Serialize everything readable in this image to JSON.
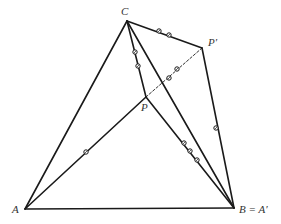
{
  "diagram": {
    "points": {
      "A": {
        "x": 25,
        "y": 209,
        "label": "A",
        "label_x": 12,
        "label_y": 213
      },
      "B": {
        "x": 234,
        "y": 208,
        "label": "B = A′",
        "label_x": 239,
        "label_y": 213
      },
      "C": {
        "x": 127,
        "y": 21,
        "label": "C",
        "label_x": 121,
        "label_y": 15
      },
      "P": {
        "x": 146,
        "y": 97,
        "label": "P",
        "label_x": 141,
        "label_y": 111
      },
      "P_prime": {
        "x": 202,
        "y": 48,
        "label": "P′",
        "label_x": 208,
        "label_y": 46
      }
    },
    "labels": {
      "A": "A",
      "B": "B = A′",
      "C": "C",
      "P": "P",
      "P_prime": "P′"
    },
    "segments": [
      {
        "from": "A",
        "to": "B",
        "style": "solid"
      },
      {
        "from": "A",
        "to": "C",
        "style": "solid"
      },
      {
        "from": "C",
        "to": "B",
        "style": "solid"
      },
      {
        "from": "A",
        "to": "P",
        "style": "solid"
      },
      {
        "from": "C",
        "to": "P",
        "style": "solid"
      },
      {
        "from": "P",
        "to": "B",
        "style": "solid"
      },
      {
        "from": "C",
        "to": "P_prime",
        "style": "solid"
      },
      {
        "from": "P_prime",
        "to": "B",
        "style": "solid"
      },
      {
        "from": "P",
        "to": "P_prime",
        "style": "dashed"
      }
    ],
    "tick_marks": [
      {
        "segment": "A-P",
        "count": 1,
        "positions": [
          [
            86,
            152
          ]
        ]
      },
      {
        "segment": "C-P",
        "count": 2,
        "positions": [
          [
            135,
            52
          ],
          [
            138,
            66
          ]
        ]
      },
      {
        "segment": "C-P_prime",
        "count": 2,
        "positions": [
          [
            159,
            31
          ],
          [
            169,
            35
          ]
        ]
      },
      {
        "segment": "P-P_prime",
        "count": 2,
        "positions": [
          [
            169,
            78
          ],
          [
            177,
            69
          ]
        ]
      },
      {
        "segment": "P-B",
        "count": 3,
        "positions": [
          [
            184,
            143
          ],
          [
            190,
            151
          ],
          [
            197,
            160
          ]
        ]
      },
      {
        "segment": "P_prime-B",
        "count": 1,
        "positions": [
          [
            216,
            128
          ]
        ]
      }
    ],
    "colors": {
      "line": "#1a1a1a",
      "label": "#333333",
      "background": "#ffffff"
    }
  }
}
